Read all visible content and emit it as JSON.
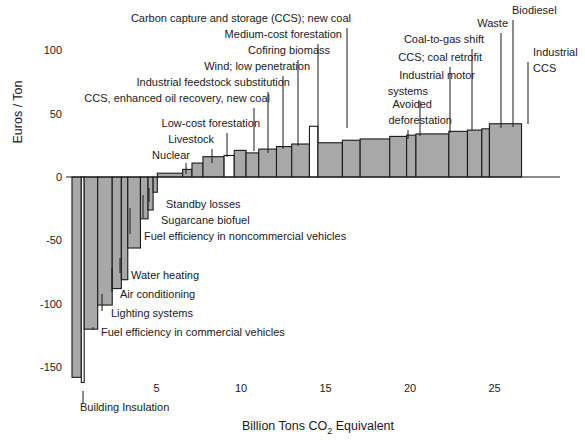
{
  "chart_data": {
    "type": "bar",
    "title": "",
    "subtitle": "",
    "xlabel": "Billion Tons CO2 Equivalent",
    "xlabel_parts": {
      "pre": "Billion Tons CO",
      "sub": "2",
      "post": " Equivalent"
    },
    "ylabel": "Euros / Ton",
    "xlim": [
      0,
      29.5
    ],
    "ylim": [
      -165,
      115
    ],
    "xticks": [
      5,
      10,
      15,
      20,
      25
    ],
    "yticks": [
      100,
      50,
      0,
      -50,
      -100,
      -150
    ],
    "ytick_labels": [
      "100",
      "50",
      "0",
      "-50",
      "-100",
      "-150"
    ],
    "grid": false,
    "legend": "none",
    "orientation": "vertical",
    "colors": {
      "bar_fill": "#a8a8a8",
      "bar_fill_alt": "#ffffff",
      "bar_stroke": "#1a1a1a",
      "axis": "#1a1a1a",
      "text": "#1a1a1a"
    },
    "bars": [
      {
        "label": "Building Insulation",
        "x0": 0.0,
        "x1": 0.55,
        "cost": -158,
        "fill": "gray",
        "annotated": true
      },
      {
        "label": "",
        "x0": 0.55,
        "x1": 0.72,
        "cost": -162,
        "fill": "white",
        "annotated": false
      },
      {
        "label": "Fuel efficiency in commercial vehicles",
        "x0": 0.72,
        "x1": 1.52,
        "cost": -120,
        "fill": "gray",
        "annotated": true
      },
      {
        "label": "Lighting systems",
        "x0": 1.52,
        "x1": 2.38,
        "cost": -101,
        "fill": "gray",
        "annotated": true
      },
      {
        "label": "Air conditioning",
        "x0": 2.38,
        "x1": 2.92,
        "cost": -88,
        "fill": "gray",
        "annotated": true
      },
      {
        "label": "Water heating",
        "x0": 2.92,
        "x1": 3.3,
        "cost": -81,
        "fill": "gray",
        "annotated": true
      },
      {
        "label": "Fuel efficiency in noncommercial vehicles",
        "x0": 3.3,
        "x1": 4.05,
        "cost": -56,
        "fill": "gray",
        "annotated": true
      },
      {
        "label": "Sugarcane biofuel",
        "x0": 4.05,
        "x1": 4.5,
        "cost": -33,
        "fill": "gray",
        "annotated": true
      },
      {
        "label": "Standby losses",
        "x0": 4.5,
        "x1": 4.8,
        "cost": -26,
        "fill": "gray",
        "annotated": true
      },
      {
        "label": "",
        "x0": 4.8,
        "x1": 5.05,
        "cost": -12,
        "fill": "gray",
        "annotated": false
      },
      {
        "label": "Nuclear",
        "x0": 5.05,
        "x1": 6.55,
        "cost": 3,
        "fill": "gray",
        "annotated": true
      },
      {
        "label": "",
        "x0": 6.55,
        "x1": 7.1,
        "cost": 6,
        "fill": "gray",
        "annotated": false
      },
      {
        "label": "Livestock",
        "x0": 7.1,
        "x1": 7.75,
        "cost": 11,
        "fill": "gray",
        "annotated": true
      },
      {
        "label": "Low-cost forestation",
        "x0": 7.75,
        "x1": 9.0,
        "cost": 16,
        "fill": "gray",
        "annotated": true
      },
      {
        "label": "",
        "x0": 9.0,
        "x1": 9.6,
        "cost": 17,
        "fill": "white",
        "annotated": false
      },
      {
        "label": "CCS, enhanced oil recovery, new coal",
        "x0": 9.6,
        "x1": 10.3,
        "cost": 21,
        "fill": "gray",
        "annotated": true
      },
      {
        "label": "Industrial feedstock substitution",
        "x0": 10.3,
        "x1": 11.05,
        "cost": 19,
        "fill": "gray",
        "annotated": true
      },
      {
        "label": "Wind; low penetration",
        "x0": 11.05,
        "x1": 12.1,
        "cost": 22,
        "fill": "gray",
        "annotated": true
      },
      {
        "label": "Cofiring biomass",
        "x0": 12.1,
        "x1": 13.0,
        "cost": 24,
        "fill": "gray",
        "annotated": true
      },
      {
        "label": "Medium-cost forestation",
        "x0": 13.0,
        "x1": 14.05,
        "cost": 26,
        "fill": "gray",
        "annotated": true
      },
      {
        "label": "Carbon capture and storage (CCS); new coal",
        "x0": 14.05,
        "x1": 14.55,
        "cost": 40,
        "fill": "white",
        "annotated": true
      },
      {
        "label": "",
        "x0": 14.55,
        "x1": 16.0,
        "cost": 27,
        "fill": "gray",
        "annotated": false
      },
      {
        "label": "",
        "x0": 16.0,
        "x1": 17.05,
        "cost": 29,
        "fill": "gray",
        "annotated": false
      },
      {
        "label": "Avoided deforestation",
        "x0": 17.05,
        "x1": 18.8,
        "cost": 30,
        "fill": "gray",
        "annotated": true
      },
      {
        "label": "Industrial motor systems",
        "x0": 18.8,
        "x1": 19.8,
        "cost": 32,
        "fill": "gray",
        "annotated": true
      },
      {
        "label": "",
        "x0": 19.8,
        "x1": 20.35,
        "cost": 33,
        "fill": "gray",
        "annotated": false
      },
      {
        "label": "CCS; coal retrofit",
        "x0": 20.35,
        "x1": 22.3,
        "cost": 34,
        "fill": "gray",
        "annotated": true
      },
      {
        "label": "Coal-to-gas shift",
        "x0": 22.3,
        "x1": 23.4,
        "cost": 36,
        "fill": "gray",
        "annotated": true
      },
      {
        "label": "Waste",
        "x0": 23.4,
        "x1": 24.25,
        "cost": 37,
        "fill": "gray",
        "annotated": true
      },
      {
        "label": "Biodiesel",
        "x0": 24.25,
        "x1": 24.7,
        "cost": 38,
        "fill": "gray",
        "annotated": true
      },
      {
        "label": "Industrial CCS",
        "x0": 24.7,
        "x1": 26.6,
        "cost": 42,
        "fill": "gray",
        "annotated": true
      }
    ],
    "annotations_top": [
      {
        "text": "Carbon capture and storage (CCS); new coal",
        "anchor": "end",
        "tx": 351,
        "ty": 22,
        "lx": 347,
        "ly0": 28,
        "ly1": 128
      },
      {
        "text": "Medium-cost forestation",
        "anchor": "end",
        "tx": 342,
        "ty": 38,
        "lx": 318,
        "ly0": 44,
        "ly1": 143
      },
      {
        "text": "Cofiring biomass",
        "anchor": "end",
        "tx": 330,
        "ty": 54,
        "lx": 298,
        "ly0": 60,
        "ly1": 146
      },
      {
        "text": "Wind; low penetration",
        "anchor": "end",
        "tx": 310,
        "ty": 70,
        "lx": 283,
        "ly0": 76,
        "ly1": 149
      },
      {
        "text": "Industrial feedstock substitution",
        "anchor": "end",
        "tx": 290,
        "ty": 86,
        "lx": 268,
        "ly0": 92,
        "ly1": 153
      },
      {
        "text": "CCS, enhanced oil recovery, new coal",
        "anchor": "end",
        "tx": 270,
        "ty": 102,
        "lx": 254,
        "ly0": 108,
        "ly1": 151
      },
      {
        "text": "Low-cost forestation",
        "anchor": "end",
        "tx": 260,
        "ty": 127,
        "lx": 227,
        "ly0": 133,
        "ly1": 157
      },
      {
        "text": "Livestock",
        "anchor": "end",
        "tx": 214,
        "ty": 143,
        "lx": 212,
        "ly0": 149,
        "ly1": 163
      },
      {
        "text": "Nuclear",
        "anchor": "end",
        "tx": 190,
        "ty": 159,
        "lx": 186,
        "ly0": 163,
        "ly1": 174
      },
      {
        "text": "Coal-to-gas shift",
        "anchor": "end",
        "tx": 484,
        "ty": 43,
        "lx": 472,
        "ly0": 49,
        "ly1": 130
      },
      {
        "text": "CCS; coal retrofit",
        "anchor": "end",
        "tx": 482,
        "ty": 61,
        "lx": 450,
        "ly0": 67,
        "ly1": 133
      },
      {
        "text": "Waste",
        "anchor": "end",
        "tx": 508,
        "ty": 27,
        "lx": 501,
        "ly0": 33,
        "ly1": 128
      },
      {
        "text": "Biodiesel",
        "anchor": "start",
        "tx": 512,
        "ty": 14,
        "lx": 513,
        "ly0": 20,
        "ly1": 127
      },
      {
        "text": "Industrial",
        "anchor": "start",
        "tx": 533,
        "ty": 56,
        "lx": 528,
        "ly0": 62,
        "ly1": 124
      },
      {
        "text": "CCS",
        "anchor": "start",
        "tx": 533,
        "ty": 72,
        "lx": null,
        "ly0": 0,
        "ly1": 0
      },
      {
        "text": "Industrial motor",
        "anchor": "end",
        "tx": 475,
        "ty": 79,
        "lx": null,
        "ly0": 0,
        "ly1": 0
      },
      {
        "text": "systems",
        "anchor": "end",
        "tx": 428,
        "ty": 95,
        "lx": 420,
        "ly0": 101,
        "ly1": 136
      },
      {
        "text": "Avoided",
        "anchor": "end",
        "tx": 432,
        "ty": 108,
        "lx": null,
        "ly0": 0,
        "ly1": 0
      },
      {
        "text": "deforestation",
        "anchor": "end",
        "tx": 452,
        "ty": 124,
        "lx": 408,
        "ly0": 130,
        "ly1": 139
      }
    ],
    "annotations_bottom": [
      {
        "text": "Standby losses",
        "anchor": "start",
        "tx": 166,
        "ty": 208,
        "lx": 149,
        "ly0": 202,
        "ly1": 188
      },
      {
        "text": "Sugarcane biofuel",
        "anchor": "start",
        "tx": 161,
        "ty": 224,
        "lx": 143,
        "ly0": 218,
        "ly1": 195
      },
      {
        "text": "Fuel efficiency in noncommercial vehicles",
        "anchor": "start",
        "tx": 144,
        "ty": 240,
        "lx": 130,
        "ly0": 234,
        "ly1": 208
      },
      {
        "text": "Water heating",
        "anchor": "start",
        "tx": 131,
        "ty": 279,
        "lx": 120,
        "ly0": 273,
        "ly1": 258
      },
      {
        "text": "Air conditioning",
        "anchor": "start",
        "tx": 120,
        "ty": 298,
        "lx": 112,
        "ly0": 292,
        "ly1": 268
      },
      {
        "text": "Lighting systems",
        "anchor": "start",
        "tx": 111,
        "ty": 317,
        "lx": 102,
        "ly0": 311,
        "ly1": 294
      },
      {
        "text": "Fuel efficiency in commercial vehicles",
        "anchor": "start",
        "tx": 101,
        "ty": 336,
        "lx": 93,
        "ly0": 330,
        "ly1": 327
      },
      {
        "text": "Building Insulation",
        "anchor": "start",
        "tx": 80,
        "ty": 411,
        "lx": 83,
        "ly0": 404,
        "ly1": 391
      }
    ]
  }
}
